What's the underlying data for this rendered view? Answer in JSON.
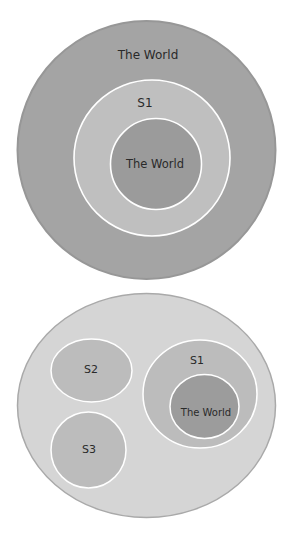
{
  "colors": {
    "background": "#ffffff",
    "outer_world_fill": "#a4a4a4",
    "outer_world_stroke": "#979797",
    "s1_ring_fill": "#bfbfbf",
    "inner_world_fill": "#9b9b9b",
    "bottom_universe_fill": "#d5d5d5",
    "bottom_universe_stroke": "#a9a9a9",
    "set_fill": "#bcbcbc",
    "bottom_world_fill": "#9c9c9c",
    "set_stroke": "#ffffff",
    "text": "#2a2a2a"
  },
  "top_diagram": {
    "outer_label": "The World",
    "ring_label": "S1",
    "inner_label": "The World"
  },
  "bottom_diagram": {
    "sets": [
      {
        "id": "S2",
        "label": "S2"
      },
      {
        "id": "S3",
        "label": "S3"
      },
      {
        "id": "S1",
        "label": "S1",
        "inner_label": "The World"
      }
    ]
  }
}
